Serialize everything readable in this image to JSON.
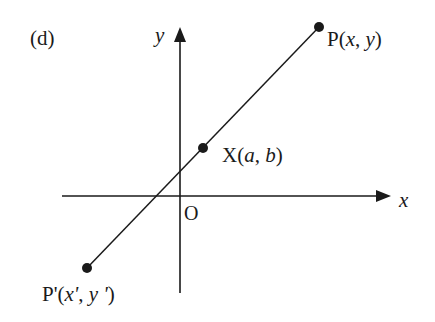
{
  "figure": {
    "panel_label": "(d)",
    "axes": {
      "x_label": "x",
      "y_label": "y",
      "origin_label": "O"
    },
    "points": [
      {
        "id": "P",
        "name": "P",
        "coords": [
          "x",
          "y"
        ]
      },
      {
        "id": "X",
        "name": "X",
        "coords": [
          "a",
          "b"
        ]
      },
      {
        "id": "Pprime",
        "name": "P'",
        "coords": [
          "x'",
          "y '"
        ]
      }
    ],
    "colors": {
      "stroke": "#1a1a1a",
      "background": "#ffffff"
    }
  },
  "text": {
    "panel": "(d)",
    "y_axis": "y",
    "x_axis": "x",
    "origin": "O",
    "P_name": "P(",
    "P_x": "x",
    "P_sep": ", ",
    "P_y": "y",
    "P_close": ")",
    "X_name": "X(",
    "X_a": "a",
    "X_sep": ", ",
    "X_b": "b",
    "X_close": ")",
    "Pp_name": "P'(",
    "Pp_x": "x'",
    "Pp_sep": ", ",
    "Pp_y": "y '",
    "Pp_close": ")"
  }
}
